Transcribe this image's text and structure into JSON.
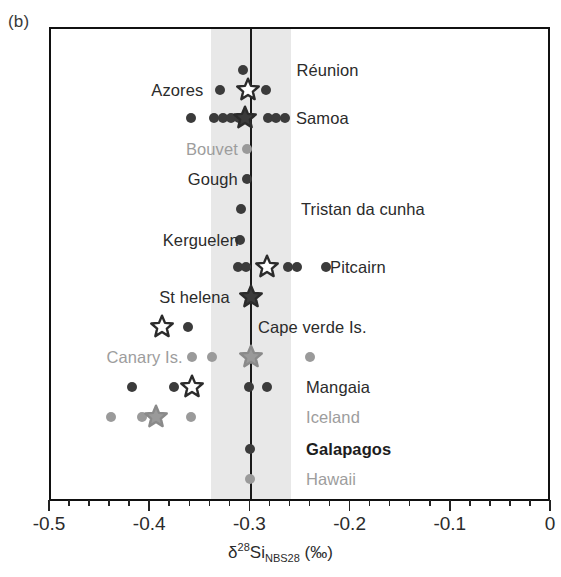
{
  "panel_label": "(b)",
  "axis": {
    "title_delta": "δ",
    "title_mass": "28",
    "title_element": "Si",
    "title_standard": "NBS28",
    "title_units": "(‰)",
    "xlim": [
      -0.5,
      0.0
    ],
    "major_ticks": [
      -0.5,
      -0.4,
      -0.3,
      -0.2,
      -0.1,
      0
    ],
    "tick_labels": [
      "-0.5",
      "-0.4",
      "-0.3",
      "-0.2",
      "-0.1",
      "0"
    ],
    "minor_tick_step": 0.02
  },
  "reference": {
    "line_value": -0.3,
    "band_min": -0.34,
    "band_max": -0.26,
    "band_color": "#e8e8e8",
    "line_color": "#1a1a1a"
  },
  "colors": {
    "dark_marker": "#3b3b3b",
    "gray_marker": "#9a9a9a",
    "dark_label": "#2b2b2b",
    "gray_label": "#9d9d9d",
    "bold_label": "#1d1d1d"
  },
  "chart_data": {
    "type": "scatter",
    "title": "",
    "xlabel": "δ28Si_NBS28 (‰)",
    "ylabel": "",
    "xlim": [
      -0.5,
      0.0
    ],
    "grid": false,
    "legend": "none",
    "note": "Ocean island basalt localities; circles are individual samples, stars are locality means. Open stars = white-filled dark-outlined, filled stars = solid.",
    "rows": [
      {
        "label": "Réunion",
        "label_style": "dark",
        "label_side": "right",
        "label_x": -0.255,
        "y": 68,
        "points": [
          {
            "x": -0.3085,
            "color": "dark"
          }
        ],
        "stars": []
      },
      {
        "label": "Azores",
        "label_style": "dark",
        "label_side": "left",
        "label_x": -0.348,
        "y": 88,
        "points": [
          {
            "x": -0.3315,
            "color": "dark"
          },
          {
            "x": -0.2855,
            "color": "dark"
          }
        ],
        "stars": [
          {
            "x": -0.3035,
            "fill": "open"
          }
        ]
      },
      {
        "label": "Samoa",
        "label_style": "dark",
        "label_side": "right",
        "label_x": -0.2555,
        "y": 116,
        "points": [
          {
            "x": -0.3605,
            "color": "dark"
          },
          {
            "x": -0.3375,
            "color": "dark"
          },
          {
            "x": -0.3285,
            "color": "dark"
          },
          {
            "x": -0.3205,
            "color": "dark"
          },
          {
            "x": -0.3125,
            "color": "dark"
          },
          {
            "x": -0.2835,
            "color": "dark"
          },
          {
            "x": -0.2755,
            "color": "dark"
          },
          {
            "x": -0.2665,
            "color": "dark"
          }
        ],
        "stars": [
          {
            "x": -0.3065,
            "fill": "filled"
          }
        ]
      },
      {
        "label": "Bouvet",
        "label_style": "gray",
        "label_side": "left",
        "label_x": -0.3135,
        "y": 147,
        "points": [
          {
            "x": -0.3045,
            "color": "gray"
          }
        ],
        "stars": []
      },
      {
        "label": "Gough",
        "label_style": "dark",
        "label_side": "left",
        "label_x": -0.3135,
        "y": 177,
        "points": [
          {
            "x": -0.3045,
            "color": "dark"
          }
        ],
        "stars": []
      },
      {
        "label": "Tristan da cunha",
        "label_style": "dark",
        "label_side": "right",
        "label_x": -0.2505,
        "y": 207,
        "points": [
          {
            "x": -0.3105,
            "color": "dark"
          }
        ],
        "stars": []
      },
      {
        "label": "Kerguelen",
        "label_style": "dark",
        "label_side": "left",
        "label_x": -0.3125,
        "y": 238,
        "points": [
          {
            "x": -0.3115,
            "color": "dark"
          }
        ],
        "stars": []
      },
      {
        "label": "Pitcairn",
        "label_style": "dark",
        "label_side": "right",
        "label_x": -0.2215,
        "y": 265,
        "points": [
          {
            "x": -0.3135,
            "color": "dark"
          },
          {
            "x": -0.3055,
            "color": "dark"
          },
          {
            "x": -0.2635,
            "color": "dark"
          },
          {
            "x": -0.2545,
            "color": "dark"
          },
          {
            "x": -0.2255,
            "color": "dark"
          }
        ],
        "stars": [
          {
            "x": -0.2845,
            "fill": "open"
          }
        ]
      },
      {
        "label": "St helena",
        "label_style": "dark",
        "label_side": "left",
        "label_x": -0.3215,
        "y": 295,
        "points": [],
        "stars": [
          {
            "x": -0.3005,
            "fill": "filled"
          }
        ]
      },
      {
        "label": "Cape verde Is.",
        "label_style": "dark",
        "label_side": "right",
        "label_x": -0.2935,
        "y": 325,
        "points": [
          {
            "x": -0.3635,
            "color": "dark"
          }
        ],
        "stars": [
          {
            "x": -0.3895,
            "fill": "open"
          }
        ]
      },
      {
        "label": "Canary Is.",
        "label_style": "gray",
        "label_side": "left",
        "label_x": -0.3685,
        "y": 355,
        "points": [
          {
            "x": -0.3595,
            "color": "gray"
          },
          {
            "x": -0.3395,
            "color": "gray"
          },
          {
            "x": -0.2415,
            "color": "gray"
          }
        ],
        "stars": [
          {
            "x": -0.3005,
            "fill": "gray"
          }
        ]
      },
      {
        "label": "Mangaia",
        "label_style": "dark",
        "label_side": "right",
        "label_x": -0.2455,
        "y": 385,
        "points": [
          {
            "x": -0.4195,
            "color": "dark"
          },
          {
            "x": -0.3775,
            "color": "dark"
          },
          {
            "x": -0.3025,
            "color": "dark"
          },
          {
            "x": -0.2845,
            "color": "dark"
          }
        ],
        "stars": [
          {
            "x": -0.3595,
            "fill": "open"
          }
        ]
      },
      {
        "label": "Iceland",
        "label_style": "gray",
        "label_side": "right",
        "label_x": -0.2455,
        "y": 415,
        "points": [
          {
            "x": -0.4405,
            "color": "gray"
          },
          {
            "x": -0.4095,
            "color": "gray"
          },
          {
            "x": -0.3605,
            "color": "gray"
          }
        ],
        "stars": [
          {
            "x": -0.3955,
            "fill": "gray"
          }
        ]
      },
      {
        "label": "Galapagos",
        "label_style": "bold",
        "label_side": "right",
        "label_x": -0.2455,
        "y": 447,
        "points": [
          {
            "x": -0.3015,
            "color": "dark"
          }
        ],
        "stars": []
      },
      {
        "label": "Hawaii",
        "label_style": "gray",
        "label_side": "right",
        "label_x": -0.2455,
        "y": 477,
        "points": [
          {
            "x": -0.3015,
            "color": "gray"
          }
        ],
        "stars": []
      }
    ]
  }
}
